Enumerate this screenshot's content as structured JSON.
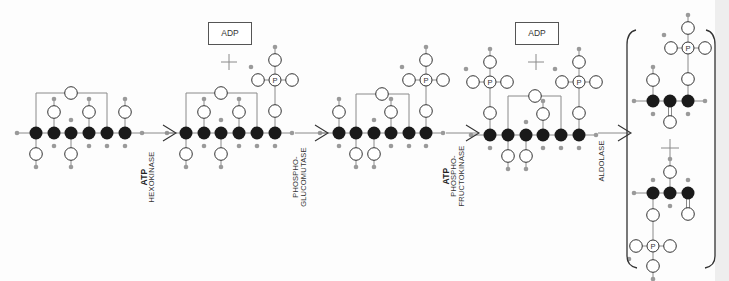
{
  "diagram": {
    "title": "",
    "colors": {
      "carbon": "#1a1a1a",
      "hydrogen": "#9a9a9a",
      "oxygen_stroke": "#333333",
      "bond": "#8a8a8a",
      "text": "#333333"
    },
    "molecules": [
      {
        "id": "glucose",
        "name": "Glucose",
        "carbons_x": [
          36,
          54,
          71,
          89,
          107,
          125
        ],
        "chain_y": 133,
        "ring": {
          "from": 0,
          "to": 4,
          "top_y": 93,
          "oxygen_x": 71
        },
        "oh_up": [
          1,
          3,
          5
        ],
        "oh_down": [
          0,
          2
        ],
        "phosphates": []
      },
      {
        "id": "glucose-6-phosphate",
        "name": "Glucose 6-phosphate",
        "carbons_x": [
          186,
          204,
          221,
          239,
          257,
          275
        ],
        "chain_y": 133,
        "ring": {
          "from": 0,
          "to": 4,
          "top_y": 93,
          "oxygen_x": 221
        },
        "oh_up": [
          1,
          3
        ],
        "oh_down": [
          0,
          2
        ],
        "phosphates": [
          {
            "carbon": 5,
            "dir": "up"
          }
        ]
      },
      {
        "id": "fructose-6-phosphate",
        "name": "Fructose 6-phosphate",
        "carbons_x": [
          339,
          356,
          374,
          391,
          409,
          426
        ],
        "chain_y": 133,
        "ring": {
          "from": 1,
          "to": 4,
          "top_y": 94,
          "oxygen_x": 382
        },
        "oh_up": [
          0,
          3
        ],
        "oh_down": [
          1,
          2
        ],
        "phosphates": [
          {
            "carbon": 5,
            "dir": "up"
          }
        ]
      },
      {
        "id": "fructose-1-6-bisphosphate",
        "name": "Fructose 1,6-bisphosphate",
        "carbons_x": [
          490,
          508,
          526,
          543,
          561,
          579
        ],
        "chain_y": 135,
        "ring": {
          "from": 1,
          "to": 4,
          "top_y": 96,
          "oxygen_x": 535
        },
        "oh_up": [
          3
        ],
        "oh_down": [
          1,
          2
        ],
        "phosphates": [
          {
            "carbon": 0,
            "dir": "up"
          },
          {
            "carbon": 5,
            "dir": "up"
          }
        ]
      }
    ],
    "products": [
      {
        "id": "glyceraldehyde-3-phosphate",
        "carbons_x": [
          653,
          670,
          688
        ],
        "chain_y": 101,
        "oh_up": [
          0
        ],
        "oh_down": [
          1
        ],
        "phosphates": [
          {
            "carbon": 2,
            "dir": "up"
          }
        ]
      },
      {
        "id": "dihydroxyacetone-phosphate",
        "carbons_x": [
          653,
          670,
          688
        ],
        "chain_y": 193,
        "oh_up": [
          1
        ],
        "oh_down": [
          2
        ],
        "phosphates": [
          {
            "carbon": 0,
            "dir": "down"
          }
        ]
      }
    ],
    "steps": [
      {
        "arrow_x": 143,
        "cofactor": "ATP",
        "enzyme_lines": [
          "HEXOKINASE"
        ],
        "side_product": "ADP",
        "adp_box_x": 208
      },
      {
        "arrow_x": 295,
        "cofactor": "",
        "enzyme_lines": [
          "PHOSPHO-",
          "GLUCOMUTASE"
        ],
        "side_product": "",
        "adp_box_x": null
      },
      {
        "arrow_x": 446,
        "cofactor": "ATP",
        "enzyme_lines": [
          "PHOSPHO-",
          "FRUCTOKINASE"
        ],
        "side_product": "ADP",
        "adp_box_x": 515
      },
      {
        "arrow_x": 598,
        "cofactor": "",
        "enzyme_lines": [
          "ALDOLASE"
        ],
        "side_product": "",
        "adp_box_x": null
      }
    ],
    "labels": {
      "adp": "ADP",
      "atp": "ATP",
      "phosphorus": "P",
      "plus": "+",
      "step1_cofactor": "ATP",
      "step1_enzyme": "HEXOKINASE",
      "step2_enzyme_1": "PHOSPHO-",
      "step2_enzyme_2": "GLUCOMUTASE",
      "step3_cofactor": "ATP",
      "step3_enzyme_1": "PHOSPHO-",
      "step3_enzyme_2": "FRUCTOKINASE",
      "step4_enzyme": "ALDOLASE",
      "adp_1": "ADP",
      "adp_2": "ADP"
    }
  }
}
